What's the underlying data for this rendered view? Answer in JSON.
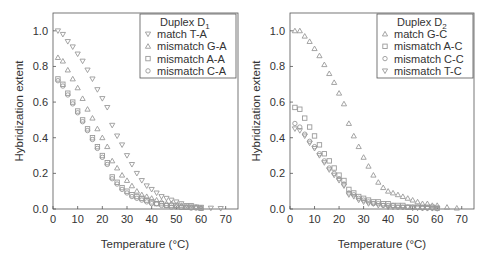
{
  "chart_data": [
    {
      "type": "scatter",
      "title": "",
      "xlabel": "Temperature (°C)",
      "ylabel": "Hybridization extent",
      "xlim": [
        0,
        75
      ],
      "ylim": [
        0,
        1.1
      ],
      "xticks": [
        0,
        10,
        20,
        30,
        40,
        50,
        60,
        70
      ],
      "yticks": [
        "0.0",
        "0.2",
        "0.4",
        "0.6",
        "0.8",
        "1.0"
      ],
      "grid": false,
      "legend_position": "upper right",
      "legend_title": "Duplex D",
      "legend_title_sub": "1",
      "series": [
        {
          "name": "match T-A",
          "marker": "triangle-down",
          "x": [
            2,
            4,
            6,
            8,
            10,
            12,
            14,
            16,
            18,
            20,
            22,
            24,
            26,
            28,
            30,
            32,
            34,
            36,
            38,
            40,
            42,
            44,
            46,
            48,
            50,
            52,
            54,
            56,
            58,
            60,
            64,
            68
          ],
          "y": [
            1.0,
            0.98,
            0.94,
            0.91,
            0.87,
            0.83,
            0.78,
            0.73,
            0.67,
            0.62,
            0.57,
            0.47,
            0.41,
            0.36,
            0.3,
            0.25,
            0.2,
            0.16,
            0.13,
            0.11,
            0.09,
            0.07,
            0.06,
            0.05,
            0.04,
            0.03,
            0.02,
            0.02,
            0.01,
            0.01,
            0.005,
            0.003
          ]
        },
        {
          "name": "mismatch G-A",
          "marker": "triangle-up",
          "x": [
            2,
            4,
            6,
            8,
            10,
            12,
            14,
            16,
            18,
            20,
            22,
            24,
            26,
            28,
            30,
            32,
            34,
            36,
            38,
            40,
            42,
            44,
            46,
            48,
            50,
            52,
            54,
            56,
            58,
            60
          ],
          "y": [
            0.85,
            0.83,
            0.78,
            0.73,
            0.68,
            0.62,
            0.56,
            0.51,
            0.45,
            0.4,
            0.35,
            0.27,
            0.23,
            0.19,
            0.16,
            0.13,
            0.1,
            0.08,
            0.07,
            0.06,
            0.05,
            0.04,
            0.03,
            0.03,
            0.02,
            0.02,
            0.01,
            0.01,
            0.01,
            0.005
          ]
        },
        {
          "name": "mismatch A-A",
          "marker": "square",
          "x": [
            2,
            4,
            6,
            8,
            10,
            12,
            14,
            16,
            18,
            20,
            22,
            24,
            26,
            28,
            30,
            32,
            34,
            36,
            38,
            40,
            42,
            44,
            46,
            48,
            50,
            52,
            54,
            56,
            58,
            60
          ],
          "y": [
            0.73,
            0.7,
            0.65,
            0.6,
            0.55,
            0.5,
            0.45,
            0.4,
            0.35,
            0.3,
            0.26,
            0.18,
            0.15,
            0.12,
            0.1,
            0.08,
            0.07,
            0.06,
            0.05,
            0.04,
            0.03,
            0.03,
            0.02,
            0.02,
            0.02,
            0.01,
            0.01,
            0.01,
            0.01,
            0.005
          ]
        },
        {
          "name": "mismatch C-A",
          "marker": "circle",
          "x": [
            2,
            4,
            6,
            8,
            10,
            12,
            14,
            16,
            18,
            20,
            22,
            24,
            26,
            28,
            30,
            32,
            34,
            36,
            38,
            40,
            42,
            44,
            46,
            48,
            50,
            52,
            54,
            56,
            58,
            60
          ],
          "y": [
            0.72,
            0.69,
            0.64,
            0.59,
            0.54,
            0.49,
            0.44,
            0.39,
            0.34,
            0.29,
            0.25,
            0.17,
            0.14,
            0.11,
            0.09,
            0.07,
            0.06,
            0.05,
            0.04,
            0.03,
            0.03,
            0.02,
            0.02,
            0.01,
            0.01,
            0.01,
            0.01,
            0.005,
            0.005,
            0.003
          ]
        }
      ]
    },
    {
      "type": "scatter",
      "title": "",
      "xlabel": "Temperature (°C)",
      "ylabel": "Hybridization extent",
      "xlim": [
        0,
        75
      ],
      "ylim": [
        0,
        1.1
      ],
      "xticks": [
        0,
        10,
        20,
        30,
        40,
        50,
        60,
        70
      ],
      "yticks": [
        "0.0",
        "0.2",
        "0.4",
        "0.6",
        "0.8",
        "1.0"
      ],
      "grid": false,
      "legend_position": "upper right",
      "legend_title": "Duplex D",
      "legend_title_sub": "2",
      "series": [
        {
          "name": "match G-C",
          "marker": "triangle-up",
          "x": [
            2,
            4,
            6,
            8,
            10,
            12,
            14,
            16,
            18,
            20,
            22,
            24,
            26,
            28,
            30,
            32,
            34,
            36,
            38,
            40,
            42,
            44,
            46,
            48,
            50,
            52,
            54,
            56,
            58,
            60,
            64,
            68
          ],
          "y": [
            1.0,
            1.0,
            0.97,
            0.94,
            0.9,
            0.86,
            0.81,
            0.76,
            0.71,
            0.65,
            0.59,
            0.48,
            0.41,
            0.35,
            0.29,
            0.24,
            0.19,
            0.15,
            0.12,
            0.1,
            0.09,
            0.08,
            0.07,
            0.06,
            0.05,
            0.04,
            0.03,
            0.03,
            0.02,
            0.02,
            0.01,
            0.005
          ]
        },
        {
          "name": "mismatch A-C",
          "marker": "square",
          "x": [
            2,
            4,
            6,
            8,
            10,
            12,
            14,
            16,
            18,
            20,
            22,
            24,
            26,
            28,
            30,
            32,
            34,
            36,
            38,
            40,
            42,
            44,
            46,
            48,
            50,
            52,
            54,
            56,
            58,
            60
          ],
          "y": [
            0.57,
            0.56,
            0.51,
            0.46,
            0.41,
            0.36,
            0.31,
            0.27,
            0.23,
            0.19,
            0.16,
            0.11,
            0.09,
            0.07,
            0.06,
            0.05,
            0.04,
            0.04,
            0.03,
            0.03,
            0.02,
            0.02,
            0.02,
            0.01,
            0.01,
            0.01,
            0.01,
            0.01,
            0.01,
            0.005
          ]
        },
        {
          "name": "mismatch C-C",
          "marker": "circle",
          "x": [
            2,
            4,
            6,
            8,
            10,
            12,
            14,
            16,
            18,
            20,
            22,
            24,
            26,
            28,
            30,
            32,
            34,
            36,
            38,
            40,
            42,
            44,
            46,
            48,
            50,
            52,
            54,
            56,
            58,
            60
          ],
          "y": [
            0.48,
            0.46,
            0.42,
            0.38,
            0.35,
            0.31,
            0.27,
            0.23,
            0.2,
            0.17,
            0.14,
            0.09,
            0.08,
            0.06,
            0.05,
            0.04,
            0.03,
            0.03,
            0.02,
            0.02,
            0.02,
            0.01,
            0.01,
            0.01,
            0.01,
            0.01,
            0.005,
            0.005,
            0.005,
            0.003
          ]
        },
        {
          "name": "mismatch T-C",
          "marker": "triangle-down",
          "x": [
            2,
            4,
            6,
            8,
            10,
            12,
            14,
            16,
            18,
            20,
            22,
            24,
            26,
            28,
            30,
            32,
            34,
            36,
            38,
            40,
            42,
            44,
            46,
            48,
            50,
            52,
            54,
            56,
            58,
            60
          ],
          "y": [
            0.45,
            0.44,
            0.41,
            0.37,
            0.34,
            0.3,
            0.26,
            0.22,
            0.19,
            0.16,
            0.13,
            0.08,
            0.07,
            0.05,
            0.04,
            0.03,
            0.03,
            0.02,
            0.02,
            0.01,
            0.01,
            0.01,
            0.01,
            0.01,
            0.005,
            0.005,
            0.005,
            0.003,
            0.003,
            0.002
          ]
        }
      ]
    }
  ],
  "colors": {
    "marker": "#9a9a9a",
    "axis": "#555555",
    "text": "#333333",
    "legend_border": "#555555"
  }
}
